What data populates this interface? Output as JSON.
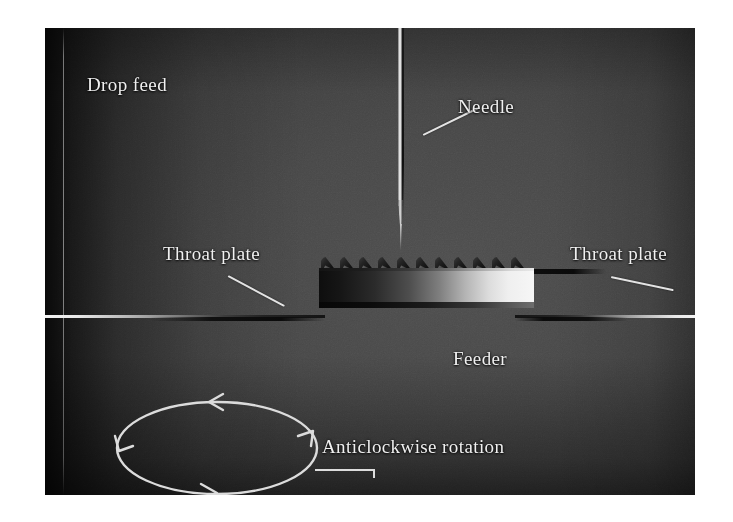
{
  "figure": {
    "kind": "photograph",
    "background_color": "#ffffff",
    "photo_bounds": {
      "x": 45,
      "y": 28,
      "width": 650,
      "height": 467
    },
    "tone": {
      "darkest": "#101010",
      "mid": "#454545",
      "brightest": "#f6f6f6"
    },
    "label_color": "#f0f0f0"
  },
  "labels": {
    "drop_feed": "Drop feed",
    "needle": "Needle",
    "throat_plate_left": "Throat plate",
    "throat_plate_right": "Throat plate",
    "feeder": "Feeder",
    "rotation": "Anticlockwise rotation"
  },
  "parts": {
    "needle": {
      "name": "needle",
      "description": "vertical sewing needle with long groove, tapering to a point"
    },
    "throat_plate_left": {
      "name": "throat-plate-left",
      "description": "horizontal plate edge entering from the left, brightest at the far left"
    },
    "throat_plate_right": {
      "name": "throat-plate-right",
      "description": "horizontal plate edge entering from the right, brightest at the far right"
    },
    "feeder": {
      "name": "feed-dog",
      "description": "toothed feed dog between the throat plates",
      "tooth_count": 11
    }
  },
  "rotation_indicator": {
    "direction": "anticlockwise",
    "shape": "ellipse",
    "arrowhead_count": 4,
    "arrowhead_positions": [
      "top",
      "right",
      "bottom",
      "left"
    ]
  }
}
